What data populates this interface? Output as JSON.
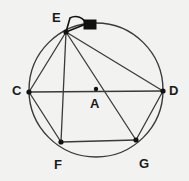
{
  "figure": {
    "background_color": "#f2f2f0",
    "stroke_color": "#3a3a3a",
    "label_color": "#1a1a1a",
    "marker_color": "#111111",
    "width": 189,
    "height": 181
  },
  "circle": {
    "center_label": "A",
    "center_x": 96,
    "center_y": 90,
    "radius": 67,
    "stroke_width": 1.4
  },
  "points": [
    {
      "label": "C",
      "x": 29,
      "y": 92,
      "label_x": 12,
      "label_y": 84,
      "dot": true
    },
    {
      "label": "D",
      "x": 163,
      "y": 91,
      "label_x": 169,
      "label_y": 84,
      "dot": true
    },
    {
      "label": "E",
      "x": 66,
      "y": 32,
      "label_x": 52,
      "label_y": 11,
      "dot": true
    },
    {
      "label": "F",
      "x": 61,
      "y": 142,
      "label_x": 54,
      "label_y": 158,
      "dot": true
    },
    {
      "label": "G",
      "x": 136,
      "y": 140,
      "label_x": 139,
      "label_y": 157,
      "dot": true
    },
    {
      "label": "A",
      "x": 96,
      "y": 89,
      "label_x": 90,
      "label_y": 97,
      "dot": true
    }
  ],
  "segments": [
    {
      "name": "chord-C-D",
      "from": "C",
      "to": "D",
      "x1": 29,
      "y1": 92,
      "x2": 163,
      "y2": 91
    },
    {
      "name": "chord-E-C",
      "from": "E",
      "to": "C",
      "x1": 66,
      "y1": 32,
      "x2": 29,
      "y2": 92
    },
    {
      "name": "chord-E-F",
      "from": "E",
      "to": "F",
      "x1": 66,
      "y1": 32,
      "x2": 61,
      "y2": 142
    },
    {
      "name": "chord-E-G",
      "from": "E",
      "to": "G",
      "x1": 66,
      "y1": 32,
      "x2": 136,
      "y2": 140
    },
    {
      "name": "chord-E-D",
      "from": "E",
      "to": "D",
      "x1": 66,
      "y1": 32,
      "x2": 163,
      "y2": 91
    },
    {
      "name": "chord-C-F",
      "from": "C",
      "to": "F",
      "x1": 29,
      "y1": 92,
      "x2": 61,
      "y2": 142
    },
    {
      "name": "chord-F-G",
      "from": "F",
      "to": "G",
      "x1": 61,
      "y1": 142,
      "x2": 136,
      "y2": 140
    },
    {
      "name": "chord-G-D",
      "from": "G",
      "to": "D",
      "x1": 136,
      "y1": 140,
      "x2": 163,
      "y2": 91
    }
  ],
  "angle_marker": {
    "name": "angle-arc-at-E",
    "vertex": "E",
    "arc_path": "M 66 32 L 86 24 A 11 11 0 0 0 70 18 Z"
  },
  "tangent_marker": {
    "name": "tangent-block-at-E",
    "x": 84,
    "y": 20,
    "width": 12,
    "height": 9
  }
}
